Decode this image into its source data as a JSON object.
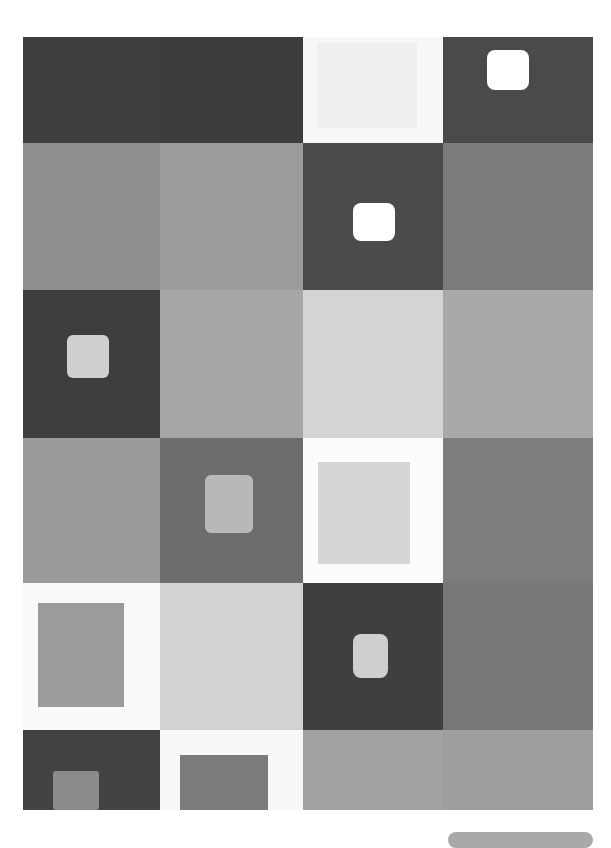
{
  "artwork": {
    "description": "Abstract grayscale grid painting of squares, some containing smaller inset squares",
    "grid": {
      "columns": [
        0,
        137,
        280,
        420,
        570
      ],
      "rows": [
        0,
        106,
        253,
        401,
        546,
        693,
        773
      ]
    },
    "cells": [
      {
        "r": 0,
        "c": 0,
        "color": "#3f3f3f"
      },
      {
        "r": 0,
        "c": 1,
        "color": "#3d3d3d"
      },
      {
        "r": 0,
        "c": 2,
        "color": "#f7f7f7",
        "inner": {
          "x": 14,
          "y": 6,
          "w": 100,
          "h": 85,
          "color": "#efefef"
        }
      },
      {
        "r": 0,
        "c": 3,
        "color": "#4a4a4a",
        "inner": {
          "x": 44,
          "y": 13,
          "w": 42,
          "h": 40,
          "color": "#ffffff",
          "radius": 8
        }
      },
      {
        "r": 1,
        "c": 0,
        "color": "#8e8e8e"
      },
      {
        "r": 1,
        "c": 1,
        "color": "#9c9c9c"
      },
      {
        "r": 1,
        "c": 2,
        "color": "#4b4b4b",
        "inner": {
          "x": 50,
          "y": 60,
          "w": 42,
          "h": 38,
          "color": "#ffffff",
          "radius": 8
        }
      },
      {
        "r": 1,
        "c": 3,
        "color": "#7b7b7b"
      },
      {
        "r": 2,
        "c": 0,
        "color": "#3e3e3e",
        "inner": {
          "x": 44,
          "y": 45,
          "w": 42,
          "h": 43,
          "color": "#cfcfcf",
          "radius": 6
        }
      },
      {
        "r": 2,
        "c": 1,
        "color": "#a6a6a6"
      },
      {
        "r": 2,
        "c": 2,
        "color": "#d4d4d4"
      },
      {
        "r": 2,
        "c": 3,
        "color": "#a9a9a9"
      },
      {
        "r": 3,
        "c": 0,
        "color": "#9a9a9a"
      },
      {
        "r": 3,
        "c": 1,
        "color": "#6d6d6d",
        "inner": {
          "x": 45,
          "y": 37,
          "w": 48,
          "h": 58,
          "color": "#b8b8b8",
          "radius": 6
        }
      },
      {
        "r": 3,
        "c": 2,
        "color": "#fbfbfb",
        "inner": {
          "x": 15,
          "y": 24,
          "w": 92,
          "h": 102,
          "color": "#d6d6d6"
        }
      },
      {
        "r": 3,
        "c": 3,
        "color": "#7d7d7d"
      },
      {
        "r": 4,
        "c": 0,
        "color": "#fafafa",
        "inner": {
          "x": 15,
          "y": 20,
          "w": 86,
          "h": 104,
          "color": "#9b9b9b"
        }
      },
      {
        "r": 4,
        "c": 1,
        "color": "#d3d3d3"
      },
      {
        "r": 4,
        "c": 2,
        "color": "#3f3f3f",
        "inner": {
          "x": 50,
          "y": 51,
          "w": 35,
          "h": 44,
          "color": "#cfcfcf",
          "radius": 8
        }
      },
      {
        "r": 4,
        "c": 3,
        "color": "#787878"
      },
      {
        "r": 5,
        "c": 0,
        "color": "#424242",
        "inner": {
          "x": 30,
          "y": 41,
          "w": 46,
          "h": 39,
          "color": "#8b8b8b",
          "radius": 3
        }
      },
      {
        "r": 5,
        "c": 1,
        "color": "#f8f8f8",
        "inner": {
          "x": 20,
          "y": 25,
          "w": 88,
          "h": 55,
          "color": "#7b7b7b"
        }
      },
      {
        "r": 5,
        "c": 2,
        "color": "#a2a2a2"
      },
      {
        "r": 5,
        "c": 3,
        "color": "#9e9e9e"
      }
    ]
  },
  "footer_bar": {
    "color": "#a9a9a9"
  }
}
